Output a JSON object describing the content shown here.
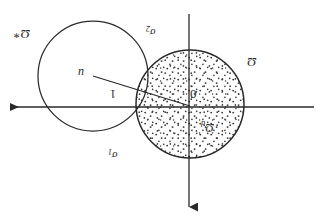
{
  "figure": {
    "background_color": "#ffffff",
    "stroke_color": "#2a2a2a",
    "width": 316,
    "height": 219,
    "orientation_note": "rotated-180",
    "axes": {
      "horizontal": {
        "name": "horizontal-axis",
        "x1": 6,
        "y1": 107,
        "x2": 314,
        "y2": 107,
        "arrow_end": "left"
      },
      "vertical": {
        "name": "vertical-axis",
        "x1": 189,
        "y1": 14,
        "x2": 189,
        "y2": 212,
        "arrow_end": "bottom"
      }
    },
    "circles": [
      {
        "name": "left-circle",
        "label": "Ω*",
        "cx": 93,
        "cy": 76,
        "r": 55,
        "filled": false
      },
      {
        "name": "right-circle",
        "label": "Ω_d",
        "cx": 190,
        "cy": 104,
        "r": 54,
        "filled": true,
        "fill_style": "stippled"
      }
    ],
    "radius_segment": {
      "name": "radius-segment",
      "from": {
        "x": 93,
        "y": 76
      },
      "to": {
        "x": 190,
        "y": 106
      },
      "length_label": "1"
    },
    "labels": {
      "omega_star": "Ω",
      "omega_star_superscript": "*",
      "sigma_1_base": "σ",
      "sigma_1_sub": "1",
      "sigma_2_base": "σ",
      "sigma_2_sub": "2",
      "omega": "Ω",
      "omega_d_base": "Ω",
      "omega_d_sub": "d",
      "origin": "0",
      "center_point": "u",
      "unit_length": "1"
    }
  }
}
